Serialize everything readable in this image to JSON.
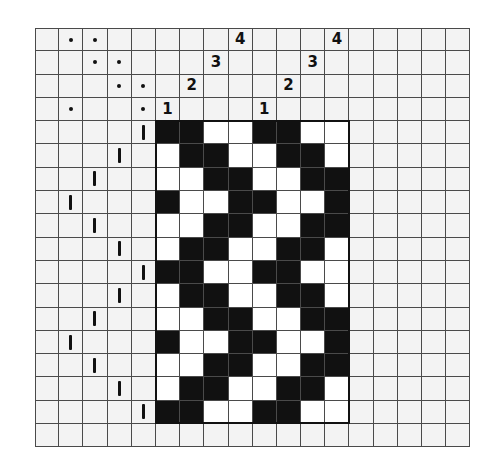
{
  "grid": {
    "columns": 18,
    "rows": 18
  },
  "layout": {
    "tieup_treadle_columns": 5,
    "threading_columns": 8,
    "right_blank_columns": 5,
    "threading_rows": 4,
    "drawdown_rows": 13,
    "bottom_blank_rows": 1
  },
  "threading": {
    "sequence": [
      1,
      2,
      3,
      4,
      1,
      2,
      3,
      4
    ],
    "labels": [
      "1",
      "2",
      "3",
      "4",
      "1",
      "2",
      "3",
      "4"
    ]
  },
  "tieup": {
    "symbol": "dot",
    "rows": [
      {
        "shaft": 4,
        "treadle_columns": [
          1,
          2
        ]
      },
      {
        "shaft": 3,
        "treadle_columns": [
          2,
          3
        ]
      },
      {
        "shaft": 2,
        "treadle_columns": [
          3,
          4
        ]
      },
      {
        "shaft": 1,
        "treadle_columns": [
          1,
          4
        ]
      }
    ]
  },
  "treadling": {
    "symbol": "vertical-tick",
    "columns": [
      4,
      3,
      2,
      1,
      2,
      3,
      4,
      3,
      2,
      1,
      2,
      3,
      4
    ]
  },
  "drawdown": [
    [
      1,
      1,
      0,
      0,
      1,
      1,
      0,
      0
    ],
    [
      0,
      1,
      1,
      0,
      0,
      1,
      1,
      0
    ],
    [
      0,
      0,
      1,
      1,
      0,
      0,
      1,
      1
    ],
    [
      1,
      0,
      0,
      1,
      1,
      0,
      0,
      1
    ],
    [
      0,
      0,
      1,
      1,
      0,
      0,
      1,
      1
    ],
    [
      0,
      1,
      1,
      0,
      0,
      1,
      1,
      0
    ],
    [
      1,
      1,
      0,
      0,
      1,
      1,
      0,
      0
    ],
    [
      0,
      1,
      1,
      0,
      0,
      1,
      1,
      0
    ],
    [
      0,
      0,
      1,
      1,
      0,
      0,
      1,
      1
    ],
    [
      1,
      0,
      0,
      1,
      1,
      0,
      0,
      1
    ],
    [
      0,
      0,
      1,
      1,
      0,
      0,
      1,
      1
    ],
    [
      0,
      1,
      1,
      0,
      0,
      1,
      1,
      0
    ],
    [
      1,
      1,
      0,
      0,
      1,
      1,
      0,
      0
    ]
  ],
  "colors": {
    "filled": "#111111",
    "empty_drawdown": "#ffffff",
    "grid_background": "#f3f3f3",
    "grid_line": "#4a4a4a"
  }
}
